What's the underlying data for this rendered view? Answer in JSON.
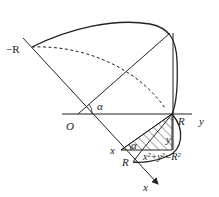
{
  "diagram": {
    "type": "geometry-solid-cross-section",
    "labels": {
      "neg_R": "−R",
      "origin": "O",
      "alpha_top": "α",
      "alpha_small": "α",
      "R_axis": "R",
      "y_axis": "y",
      "x_point": "x",
      "y_point": "y",
      "R_lower": "R",
      "x_axis": "x",
      "equation": "x²+y²=R²"
    },
    "colors": {
      "stroke": "#222222",
      "background": "#ffffff"
    }
  }
}
